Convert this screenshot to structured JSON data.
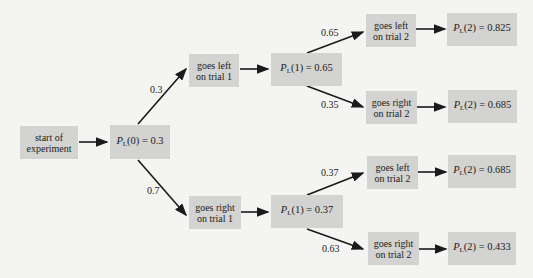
{
  "diagram": {
    "type": "probability-tree",
    "nodes": {
      "start": "start of experiment",
      "p0": {
        "var": "P",
        "sub": "L",
        "arg": "(0)",
        "value": "= 0.3"
      },
      "left1": "goes left on trial 1",
      "right1": "goes right on trial 1",
      "p1_left": {
        "var": "P",
        "sub": "L",
        "arg": "(1)",
        "value": "= 0.65"
      },
      "p1_right": {
        "var": "P",
        "sub": "L",
        "arg": "(1)",
        "value": "= 0.37"
      },
      "left2_a": "goes left on trial 2",
      "right2_a": "goes right on trial 2",
      "left2_b": "goes left on trial 2",
      "right2_b": "goes right on trial 2",
      "p2_aa": {
        "var": "P",
        "sub": "L",
        "arg": "(2)",
        "value": "= 0.825"
      },
      "p2_ab": {
        "var": "P",
        "sub": "L",
        "arg": "(2)",
        "value": "= 0.685"
      },
      "p2_ba": {
        "var": "P",
        "sub": "L",
        "arg": "(2)",
        "value": "= 0.685"
      },
      "p2_bb": {
        "var": "P",
        "sub": "L",
        "arg": "(2)",
        "value": "= 0.433"
      }
    },
    "edge_labels": {
      "p0_left": "0.3",
      "p0_right": "0.7",
      "p1l_left": "0.65",
      "p1l_right": "0.35",
      "p1r_left": "0.37",
      "p1r_right": "0.63"
    },
    "colors": {
      "box": "#d3d3d1",
      "background": "#f4f4f2",
      "line": "#1a1a1a"
    }
  }
}
